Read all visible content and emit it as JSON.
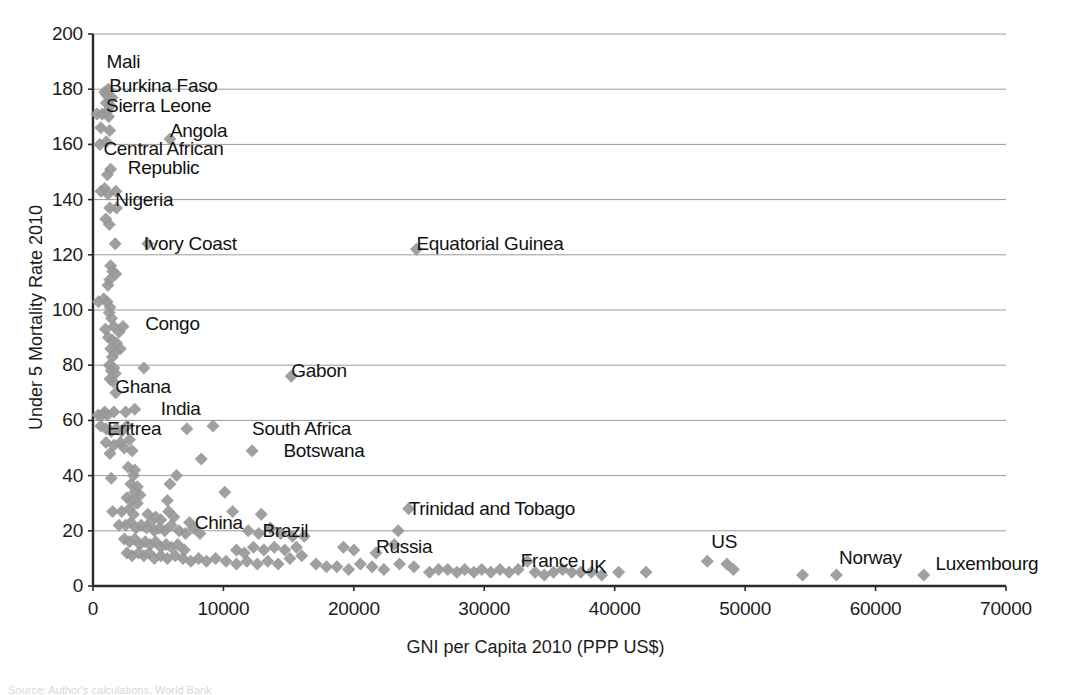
{
  "chart_data": {
    "type": "scatter",
    "title": "",
    "xlabel": "GNI per Capita 2010 (PPP US$)",
    "ylabel": "Under 5 Mortality Rate 2010",
    "xlim": [
      0,
      70000
    ],
    "ylim": [
      0,
      200
    ],
    "xticks": [
      0,
      10000,
      20000,
      30000,
      40000,
      50000,
      60000,
      70000
    ],
    "yticks": [
      0,
      20,
      40,
      60,
      80,
      100,
      120,
      140,
      160,
      180,
      200
    ],
    "xtick_labels": [
      "0",
      "10000",
      "20000",
      "30000",
      "40000",
      "50000",
      "60000",
      "70000"
    ],
    "ytick_labels": [
      "0",
      "20",
      "40",
      "60",
      "80",
      "100",
      "120",
      "140",
      "160",
      "180",
      "200"
    ],
    "grid": "horizontal",
    "legend": "none",
    "marker": "diamond",
    "marker_color": "#989898",
    "marker_size": 13,
    "annotations": [
      {
        "label": "Mali",
        "x": 1030,
        "y": 190,
        "anchor": "left",
        "lines": [
          "Mali"
        ]
      },
      {
        "label": "Burkina Faso",
        "x": 1250,
        "y": 181,
        "anchor": "left",
        "lines": [
          "Burkina Faso"
        ]
      },
      {
        "label": "Sierra Leone",
        "x": 1000,
        "y": 174,
        "anchor": "left",
        "lines": [
          "Sierra Leone"
        ]
      },
      {
        "label": "Angola",
        "x": 5900,
        "y": 165,
        "anchor": "left",
        "lines": [
          "Angola"
        ]
      },
      {
        "label": "Central African Republic",
        "x": 800,
        "y": 155,
        "anchor": "left",
        "lines": [
          "Central African",
          "Republic"
        ]
      },
      {
        "label": "Nigeria",
        "x": 1700,
        "y": 140,
        "anchor": "left",
        "lines": [
          "Nigeria"
        ]
      },
      {
        "label": "Ivory Coast",
        "x": 3900,
        "y": 124,
        "anchor": "left",
        "lines": [
          "Ivory Coast"
        ]
      },
      {
        "label": "Equatorial Guinea",
        "x": 24800,
        "y": 124,
        "anchor": "left",
        "lines": [
          "Equatorial Guinea"
        ]
      },
      {
        "label": "Congo",
        "x": 4000,
        "y": 95,
        "anchor": "left",
        "lines": [
          "Congo"
        ]
      },
      {
        "label": "Ghana",
        "x": 1700,
        "y": 72,
        "anchor": "left",
        "lines": [
          "Ghana"
        ]
      },
      {
        "label": "Gabon",
        "x": 15200,
        "y": 78,
        "anchor": "left",
        "lines": [
          "Gabon"
        ]
      },
      {
        "label": "India",
        "x": 5200,
        "y": 64,
        "anchor": "left",
        "lines": [
          "India"
        ]
      },
      {
        "label": "Eritrea",
        "x": 1100,
        "y": 57,
        "anchor": "left",
        "lines": [
          "Eritrea"
        ]
      },
      {
        "label": "South Africa",
        "x": 12200,
        "y": 57,
        "anchor": "left",
        "lines": [
          "South Africa"
        ]
      },
      {
        "label": "Botswana",
        "x": 14600,
        "y": 49,
        "anchor": "left",
        "lines": [
          "Botswana"
        ]
      },
      {
        "label": "China",
        "x": 7800,
        "y": 23,
        "anchor": "left",
        "lines": [
          "China"
        ]
      },
      {
        "label": "Brazil",
        "x": 13000,
        "y": 20,
        "anchor": "left",
        "lines": [
          "Brazil"
        ]
      },
      {
        "label": "Trinidad and Tobago",
        "x": 24200,
        "y": 28,
        "anchor": "left",
        "lines": [
          "Trinidad and Tobago"
        ]
      },
      {
        "label": "Russia",
        "x": 21700,
        "y": 14,
        "anchor": "left",
        "lines": [
          "Russia"
        ]
      },
      {
        "label": "France",
        "x": 32800,
        "y": 9,
        "anchor": "left",
        "lines": [
          "France"
        ]
      },
      {
        "label": "UK",
        "x": 37400,
        "y": 7,
        "anchor": "left",
        "lines": [
          "UK"
        ]
      },
      {
        "label": "US",
        "x": 47400,
        "y": 16,
        "anchor": "left",
        "lines": [
          "US"
        ]
      },
      {
        "label": "Norway",
        "x": 57200,
        "y": 10,
        "anchor": "left",
        "lines": [
          "Norway"
        ]
      },
      {
        "label": "Luxembourg",
        "x": 64600,
        "y": 8,
        "anchor": "left",
        "lines": [
          "Luxembourg"
        ]
      }
    ],
    "points": [
      [
        1030,
        178
      ],
      [
        1250,
        176
      ],
      [
        1180,
        180
      ],
      [
        1350,
        174
      ],
      [
        900,
        179
      ],
      [
        1100,
        172
      ],
      [
        700,
        171
      ],
      [
        300,
        171
      ],
      [
        1450,
        177
      ],
      [
        1020,
        175
      ],
      [
        1200,
        170
      ],
      [
        600,
        166
      ],
      [
        1280,
        165
      ],
      [
        1020,
        161
      ],
      [
        520,
        160
      ],
      [
        1350,
        151
      ],
      [
        1100,
        149
      ],
      [
        900,
        144
      ],
      [
        1750,
        143
      ],
      [
        1150,
        142
      ],
      [
        620,
        143
      ],
      [
        1280,
        137
      ],
      [
        1800,
        137
      ],
      [
        980,
        133
      ],
      [
        1250,
        131
      ],
      [
        1700,
        124
      ],
      [
        1350,
        116
      ],
      [
        1500,
        114
      ],
      [
        1750,
        113
      ],
      [
        1280,
        111
      ],
      [
        1150,
        109
      ],
      [
        820,
        104
      ],
      [
        420,
        103
      ],
      [
        1080,
        103
      ],
      [
        1300,
        101
      ],
      [
        1250,
        99
      ],
      [
        1420,
        97
      ],
      [
        950,
        93
      ],
      [
        1600,
        94
      ],
      [
        2300,
        94
      ],
      [
        1180,
        90
      ],
      [
        1500,
        89
      ],
      [
        1800,
        88
      ],
      [
        2000,
        92
      ],
      [
        1350,
        86
      ],
      [
        1750,
        85
      ],
      [
        2100,
        86
      ],
      [
        1480,
        83
      ],
      [
        1250,
        80
      ],
      [
        1600,
        79
      ],
      [
        3900,
        79
      ],
      [
        1400,
        78
      ],
      [
        1720,
        77
      ],
      [
        1300,
        75
      ],
      [
        1550,
        74
      ],
      [
        1750,
        70
      ],
      [
        400,
        62
      ],
      [
        700,
        62
      ],
      [
        900,
        63
      ],
      [
        1100,
        62
      ],
      [
        1600,
        63
      ],
      [
        2500,
        63
      ],
      [
        3200,
        64
      ],
      [
        600,
        58
      ],
      [
        1000,
        57
      ],
      [
        1400,
        56
      ],
      [
        1800,
        57
      ],
      [
        2200,
        56
      ],
      [
        2600,
        58
      ],
      [
        7200,
        57
      ],
      [
        9200,
        58
      ],
      [
        1000,
        52
      ],
      [
        1600,
        51
      ],
      [
        2100,
        52
      ],
      [
        2400,
        50
      ],
      [
        2800,
        53
      ],
      [
        3000,
        49
      ],
      [
        12200,
        49
      ],
      [
        1300,
        48
      ],
      [
        8300,
        46
      ],
      [
        1400,
        39
      ],
      [
        2700,
        43
      ],
      [
        3200,
        42
      ],
      [
        3100,
        40
      ],
      [
        6400,
        40
      ],
      [
        2900,
        37
      ],
      [
        3400,
        36
      ],
      [
        5900,
        37
      ],
      [
        3200,
        34
      ],
      [
        10100,
        34
      ],
      [
        2600,
        32
      ],
      [
        3000,
        31
      ],
      [
        3400,
        30
      ],
      [
        3600,
        33
      ],
      [
        5700,
        31
      ],
      [
        1500,
        27
      ],
      [
        2200,
        27
      ],
      [
        2800,
        28
      ],
      [
        3100,
        26
      ],
      [
        4200,
        26
      ],
      [
        4800,
        25
      ],
      [
        5200,
        24
      ],
      [
        5800,
        27
      ],
      [
        6200,
        25
      ],
      [
        7400,
        23
      ],
      [
        10700,
        27
      ],
      [
        12900,
        26
      ],
      [
        24200,
        28
      ],
      [
        2000,
        22
      ],
      [
        2500,
        22
      ],
      [
        2900,
        23
      ],
      [
        3300,
        21
      ],
      [
        3700,
        22
      ],
      [
        4100,
        21
      ],
      [
        4400,
        23
      ],
      [
        4700,
        20
      ],
      [
        5100,
        21
      ],
      [
        5500,
        20
      ],
      [
        6000,
        22
      ],
      [
        6600,
        20
      ],
      [
        7100,
        19
      ],
      [
        7700,
        21
      ],
      [
        8200,
        19
      ],
      [
        11900,
        20
      ],
      [
        12700,
        19
      ],
      [
        13600,
        21
      ],
      [
        14400,
        19
      ],
      [
        15300,
        18
      ],
      [
        16200,
        18
      ],
      [
        23400,
        20
      ],
      [
        2400,
        17
      ],
      [
        2800,
        16
      ],
      [
        3200,
        17
      ],
      [
        3600,
        15
      ],
      [
        4000,
        16
      ],
      [
        4400,
        15
      ],
      [
        4800,
        16
      ],
      [
        5200,
        14
      ],
      [
        5600,
        15
      ],
      [
        6000,
        14
      ],
      [
        6500,
        15
      ],
      [
        7000,
        13
      ],
      [
        11000,
        13
      ],
      [
        11600,
        12
      ],
      [
        12300,
        14
      ],
      [
        13100,
        13
      ],
      [
        13900,
        14
      ],
      [
        14700,
        13
      ],
      [
        15600,
        14
      ],
      [
        19200,
        14
      ],
      [
        20000,
        13
      ],
      [
        21700,
        12
      ],
      [
        23100,
        15
      ],
      [
        2600,
        12
      ],
      [
        3000,
        11
      ],
      [
        3500,
        12
      ],
      [
        3900,
        11
      ],
      [
        4300,
        12
      ],
      [
        4700,
        10
      ],
      [
        5200,
        11
      ],
      [
        5700,
        10
      ],
      [
        6300,
        11
      ],
      [
        6900,
        10
      ],
      [
        7500,
        9
      ],
      [
        8100,
        10
      ],
      [
        8700,
        9
      ],
      [
        9400,
        10
      ],
      [
        10200,
        9
      ],
      [
        11000,
        8
      ],
      [
        11800,
        9
      ],
      [
        12600,
        8
      ],
      [
        13400,
        9
      ],
      [
        14200,
        8
      ],
      [
        15100,
        10
      ],
      [
        16000,
        11
      ],
      [
        17100,
        8
      ],
      [
        17900,
        7
      ],
      [
        18700,
        7
      ],
      [
        19600,
        6
      ],
      [
        20500,
        8
      ],
      [
        21400,
        7
      ],
      [
        22300,
        6
      ],
      [
        23500,
        8
      ],
      [
        24800,
        122
      ],
      [
        15200,
        76
      ],
      [
        5900,
        162
      ],
      [
        4200,
        124
      ],
      [
        27200,
        6
      ],
      [
        27900,
        5
      ],
      [
        28500,
        6
      ],
      [
        29200,
        5
      ],
      [
        29800,
        6
      ],
      [
        30500,
        5
      ],
      [
        31200,
        6
      ],
      [
        31900,
        5
      ],
      [
        32600,
        6
      ],
      [
        33300,
        9
      ],
      [
        33900,
        5
      ],
      [
        34600,
        4
      ],
      [
        35300,
        5
      ],
      [
        36000,
        6
      ],
      [
        36700,
        5
      ],
      [
        37400,
        5
      ],
      [
        38200,
        5
      ],
      [
        39000,
        4
      ],
      [
        40300,
        5
      ],
      [
        42400,
        5
      ],
      [
        47100,
        9
      ],
      [
        48600,
        8
      ],
      [
        49100,
        6
      ],
      [
        54400,
        4
      ],
      [
        57000,
        4
      ],
      [
        63700,
        4
      ],
      [
        25800,
        5
      ],
      [
        26500,
        6
      ],
      [
        24600,
        7
      ]
    ]
  },
  "bottom_caption": {
    "text": "Source: Author's calculations, World Bank"
  }
}
